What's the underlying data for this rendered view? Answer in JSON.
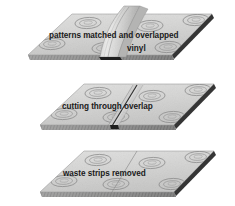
{
  "figure": {
    "background_color": "#ffffff",
    "surface_color": "#d7d7d6",
    "surface_shade_color": "#c3c3c2",
    "edge_dark_color": "#2b2b2b",
    "pattern_line_color": "#7d7d7d",
    "text_color": "#1a1a1a"
  },
  "panels": [
    {
      "id": "panel-overlap",
      "index": 1,
      "caption": "patterns matched and overlapped",
      "secondary_caption": "vinyl",
      "state": "overlapped-with-raised-fold"
    },
    {
      "id": "panel-cutting",
      "index": 2,
      "caption": "cutting through overlap",
      "secondary_caption": "",
      "state": "cut-line-through-overlap"
    },
    {
      "id": "panel-finished",
      "index": 3,
      "caption": "waste strips removed",
      "secondary_caption": "",
      "state": "flat-finished-seam"
    }
  ]
}
